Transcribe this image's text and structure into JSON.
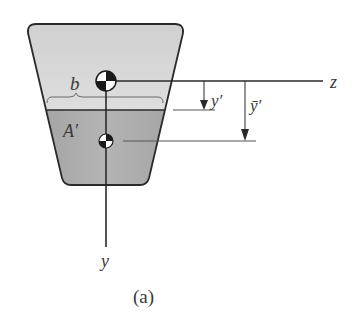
{
  "figure": {
    "caption": "(a)",
    "labels": {
      "width": "b",
      "partial_area": "A′",
      "y_prime": "y′",
      "y_bar_prime": "ȳ′",
      "z_axis": "z",
      "y_axis": "y"
    },
    "colors": {
      "upper_fill": "#d6d6d6",
      "lower_fill": "#a9a9a9",
      "stroke": "#2a2a2a",
      "text": "#3a3a3a"
    },
    "shape": {
      "type": "trapezoid cross-section",
      "top_left": [
        28,
        24
      ],
      "top_right": [
        183,
        24
      ],
      "bottom_right": [
        148,
        185
      ],
      "bottom_left": [
        63,
        185
      ],
      "cut_line_y": 110
    },
    "centroids": [
      {
        "name": "section-centroid",
        "cx": 106,
        "cy": 81,
        "r": 10
      },
      {
        "name": "area-A-prime-centroid",
        "cx": 106,
        "cy": 141,
        "r": 7
      }
    ],
    "dimensions": [
      {
        "name": "y-prime",
        "from_y": 81,
        "to_y": 110,
        "x": 204
      },
      {
        "name": "y-bar-prime",
        "from_y": 81,
        "to_y": 141,
        "x": 245
      }
    ]
  }
}
